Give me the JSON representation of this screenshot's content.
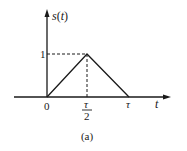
{
  "figure": {
    "caption": "(a)",
    "y_axis_label": "s(t)",
    "x_axis_label": "t",
    "y_tick_label": "1",
    "x_tick_labels": {
      "origin": "0",
      "half_tau_num": "τ",
      "half_tau_den": "2",
      "tau": "τ"
    },
    "signal": {
      "type": "triangular-pulse",
      "points": [
        [
          0,
          0
        ],
        [
          "τ/2",
          1
        ],
        [
          "τ",
          0
        ]
      ]
    },
    "colors": {
      "stroke": "#1a1a1a",
      "background": "#ffffff"
    }
  }
}
